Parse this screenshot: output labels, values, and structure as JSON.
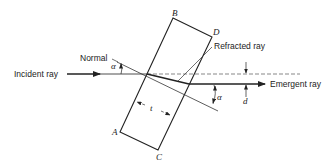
{
  "diagram": {
    "labels": {
      "incident_ray": "Incident ray",
      "normal": "Normal",
      "refracted_ray": "Refracted ray",
      "emergent_ray": "Emergent ray",
      "alpha_top": "α",
      "alpha_bottom": "α",
      "thickness": "t",
      "displacement": "d",
      "corner_a": "A",
      "corner_b": "B",
      "corner_c": "C",
      "corner_d": "D"
    },
    "colors": {
      "line": "#222222",
      "background": "#ffffff"
    }
  }
}
